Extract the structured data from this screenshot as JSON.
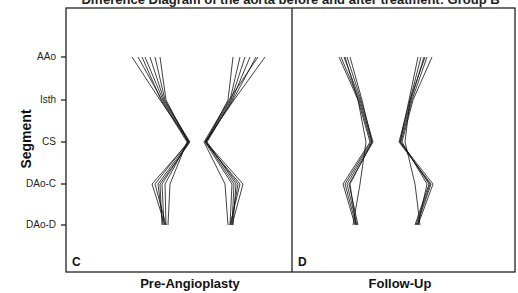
{
  "title": "Difference Diagram of the aorta before and after treatment: Group B",
  "ylabel": "Segment",
  "segments": [
    "AAo",
    "Isth",
    "CS",
    "DAo-C",
    "DAo-D"
  ],
  "panels": [
    {
      "id": "C",
      "label": "C",
      "xlabel": "Pre-Angioplasty"
    },
    {
      "id": "D",
      "label": "D",
      "xlabel": "Follow-Up"
    }
  ],
  "colors": {
    "line": "#111111",
    "axis": "#222222",
    "background": "#ffffff"
  },
  "chart_data": [
    {
      "type": "line",
      "panel": "C",
      "title": "Pre-Angioplasty",
      "xlabel": "Pre-Angioplasty",
      "ylabel": "Segment",
      "categories": [
        "AAo",
        "Isth",
        "CS",
        "DAo-C",
        "DAo-D"
      ],
      "series_left_x_px": [
        [
          132,
          160,
          189,
          152,
          165
        ],
        [
          138,
          162,
          188,
          155,
          166
        ],
        [
          145,
          163,
          189,
          158,
          163
        ],
        [
          150,
          164,
          190,
          160,
          162
        ],
        [
          155,
          165,
          189,
          162,
          164
        ],
        [
          160,
          166,
          188,
          165,
          166
        ],
        [
          142,
          161,
          187,
          170,
          168
        ]
      ],
      "series_right_x_px": [
        [
          233,
          228,
          206,
          243,
          232
        ],
        [
          240,
          230,
          205,
          240,
          230
        ],
        [
          245,
          231,
          206,
          238,
          231
        ],
        [
          250,
          232,
          207,
          236,
          233
        ],
        [
          256,
          233,
          206,
          234,
          232
        ],
        [
          265,
          234,
          205,
          232,
          230
        ],
        [
          258,
          229,
          204,
          225,
          228
        ]
      ],
      "grid": false,
      "legend": "none"
    },
    {
      "type": "line",
      "panel": "D",
      "title": "Follow-Up",
      "xlabel": "Follow-Up",
      "ylabel": "Segment",
      "categories": [
        "AAo",
        "Isth",
        "CS",
        "DAo-C",
        "DAo-D"
      ],
      "series_left_x_px": [
        [
          339,
          358,
          370,
          343,
          355
        ],
        [
          341,
          359,
          371,
          345,
          356
        ],
        [
          344,
          360,
          372,
          347,
          357
        ],
        [
          347,
          361,
          373,
          349,
          358
        ],
        [
          350,
          362,
          372,
          350,
          356
        ],
        [
          345,
          358,
          366,
          360,
          353
        ]
      ],
      "series_right_x_px": [
        [
          418,
          409,
          400,
          433,
          418
        ],
        [
          421,
          410,
          399,
          431,
          417
        ],
        [
          424,
          411,
          400,
          430,
          416
        ],
        [
          427,
          412,
          401,
          429,
          415
        ],
        [
          432,
          413,
          402,
          427,
          418
        ],
        [
          425,
          410,
          405,
          415,
          420
        ]
      ],
      "grid": false,
      "legend": "none"
    }
  ]
}
